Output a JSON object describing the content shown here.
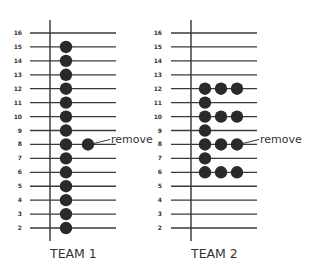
{
  "panels": [
    {
      "id": "team1",
      "title": "TEAM 1",
      "rows": [
        16,
        15,
        14,
        13,
        12,
        11,
        10,
        9,
        8,
        7,
        6,
        5,
        4,
        3,
        2
      ],
      "columns": {
        "15": 1,
        "14": 1,
        "13": 1,
        "12": 1,
        "11": 1,
        "10": 1,
        "9": 1,
        "8": 1,
        "7": 1,
        "6": 1,
        "5": 1,
        "4": 1,
        "3": 1,
        "2": 1
      },
      "extra": [
        {
          "row": 8,
          "col": 2,
          "annotation": "remove"
        }
      ]
    },
    {
      "id": "team2",
      "title": "TEAM 2",
      "rows": [
        16,
        15,
        14,
        13,
        12,
        11,
        10,
        9,
        8,
        7,
        6,
        5,
        4,
        3,
        2
      ],
      "columns": {
        "12": 3,
        "11": 1,
        "10": 3,
        "9": 1,
        "8": 3,
        "7": 1,
        "6": 3
      },
      "extra": [
        {
          "row": 8,
          "col": 3,
          "annotation": "remove"
        }
      ]
    }
  ],
  "colors": {
    "dot": "#2a2a2a",
    "line": "#3a3a3a"
  }
}
